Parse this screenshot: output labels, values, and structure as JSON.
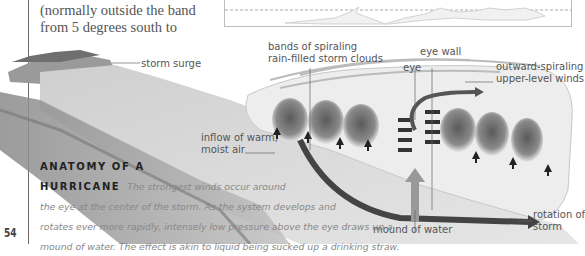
{
  "page": {
    "page_number": "54",
    "body_text_lines": [
      "(normally outside the band",
      "from 5 degrees south to"
    ]
  },
  "inset_map": {
    "description": "world map strip with dashed latitude line"
  },
  "illustration": {
    "title": "Anatomy of a hurricane cross-section",
    "labels": {
      "storm_surge": "storm surge",
      "bands": [
        "bands of spiraling",
        "rain-filled storm clouds"
      ],
      "eye_wall": "eye wall",
      "eye": "eye",
      "outward": [
        "outward-spiraling",
        "upper-level winds"
      ],
      "inflow": [
        "inflow of warm,",
        "moist air"
      ],
      "mound": "mound of water",
      "rotation": [
        "rotation of",
        "storm"
      ]
    }
  },
  "caption": {
    "title_line1": "ANATOMY OF A",
    "title_line2": "HURRICANE",
    "lines": [
      "The strongest winds occur around",
      "the eye at the center of the storm. As the system develops and",
      "rotates ever more rapidly, intensely low pressure above the eye draws up a",
      "mound of water. The effect is akin to liquid being sucked up a drinking straw."
    ]
  }
}
